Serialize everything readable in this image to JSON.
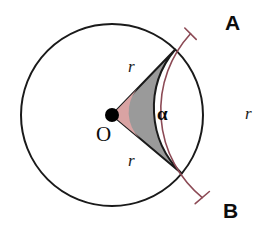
{
  "figure": {
    "background_color": "#ffffff"
  },
  "colors": {
    "circle_outline": "#1a1a1a",
    "sector_fill": "#9a9a9a",
    "sector_outline": "#1a1a1a",
    "angle_arc_fill": "#d9a3a3",
    "bracket": "#8c4a55",
    "center_dot": "#000000",
    "label_text": "#111111"
  },
  "geometry": {
    "center_x": 112,
    "center_y": 115,
    "radius": 91,
    "sector_start_angle_deg": 46,
    "sector_end_angle_deg": -40,
    "angle_arc_radius": 36,
    "bracket_radius": 113,
    "center_dot_radius": 7,
    "circle_stroke_width": 2,
    "sector_stroke_width": 2,
    "bracket_stroke_width": 1.6,
    "bracket_tick_length": 13
  },
  "labels": {
    "point_a": "A",
    "point_b": "B",
    "origin": "O",
    "angle": "α",
    "radius_upper": "r",
    "radius_lower": "r",
    "radius_arc": "r"
  }
}
